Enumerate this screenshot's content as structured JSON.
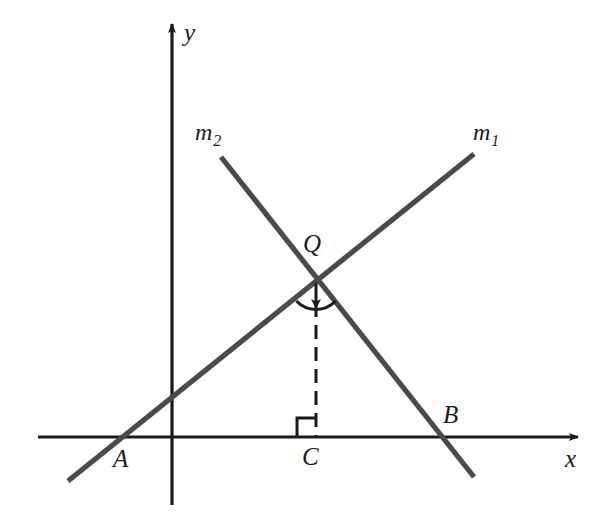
{
  "figure": {
    "background_color": "#fefefe",
    "axis_color": "#1a1a1a",
    "line_color": "#4a4a4a",
    "label_color": "#1a1a1a"
  },
  "axes": {
    "x_axis": {
      "label": "x",
      "label_x": 565,
      "label_y": 446,
      "start_x": 38,
      "end_x": 578,
      "y": 437,
      "arrow": "right"
    },
    "y_axis": {
      "label": "y",
      "label_x": 184,
      "label_y": 20,
      "x": 172,
      "start_y": 505,
      "end_y": 24,
      "arrow": "up"
    }
  },
  "lines": [
    {
      "name": "m1",
      "label": "m",
      "subscript": "1",
      "label_x": 473,
      "label_y": 120,
      "x1": 68,
      "y1": 481,
      "x2": 474,
      "y2": 154,
      "description": "rising line through A and Q"
    },
    {
      "name": "m2",
      "label": "m",
      "subscript": "2",
      "label_x": 195,
      "label_y": 120,
      "x1": 221,
      "y1": 157,
      "x2": 474,
      "y2": 477,
      "description": "falling line through Q and B"
    }
  ],
  "points": [
    {
      "name": "A",
      "label": "A",
      "x": 122,
      "y": 437,
      "label_x": 113,
      "label_y": 446,
      "description": "x-intercept of line m1"
    },
    {
      "name": "B",
      "label": "B",
      "x": 440,
      "y": 437,
      "label_x": 443,
      "label_y": 402,
      "description": "x-intercept of line m2"
    },
    {
      "name": "C",
      "label": "C",
      "x": 316,
      "y": 437,
      "label_x": 302,
      "label_y": 444,
      "description": "foot of perpendicular from Q to x-axis"
    },
    {
      "name": "Q",
      "label": "Q",
      "x": 316,
      "y": 281,
      "label_x": 303,
      "label_y": 231,
      "description": "intersection point of m1 and m2"
    }
  ],
  "annotations": {
    "perpendicular_drop": {
      "name": "QC",
      "style": "dashed",
      "from_x": 316,
      "from_y": 281,
      "to_x": 316,
      "to_y": 437,
      "dash": "14 8"
    },
    "right_angle_mark": {
      "name": "right-angle-at-C",
      "x": 297,
      "y": 418,
      "size": 19,
      "corner": "left-of-dashed-line"
    },
    "angle_arc": {
      "name": "angle-arc-at-Q",
      "cx": 316,
      "cy": 281,
      "radius": 26,
      "description": "arc below Q spanning the two lines"
    },
    "arrowhead": {
      "name": "downward-arrow-at-Q",
      "x": 316,
      "y": 305,
      "direction": "down"
    }
  }
}
